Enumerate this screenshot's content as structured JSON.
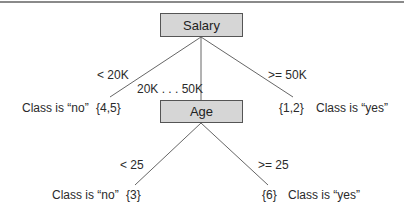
{
  "diagram": {
    "type": "decision-tree",
    "root": {
      "label": "Salary",
      "branches": [
        {
          "condition": "< 20K",
          "leaf_set": "{4,5}",
          "leaf_class": "Class is “no”"
        },
        {
          "condition": "20K . . . 50K",
          "child": "Age"
        },
        {
          "condition": ">= 50K",
          "leaf_set": "{1,2}",
          "leaf_class": "Class is “yes”"
        }
      ]
    },
    "age_node": {
      "label": "Age",
      "branches": [
        {
          "condition": "< 25",
          "leaf_set": "{3}",
          "leaf_class": "Class is “no”"
        },
        {
          "condition": ">= 25",
          "leaf_set": "{6}",
          "leaf_class": "Class is “yes”"
        }
      ]
    }
  },
  "colors": {
    "node_fill": "#d6d6d6",
    "node_border": "#555555",
    "edge": "#666666",
    "rule": "#8a8a8a"
  }
}
